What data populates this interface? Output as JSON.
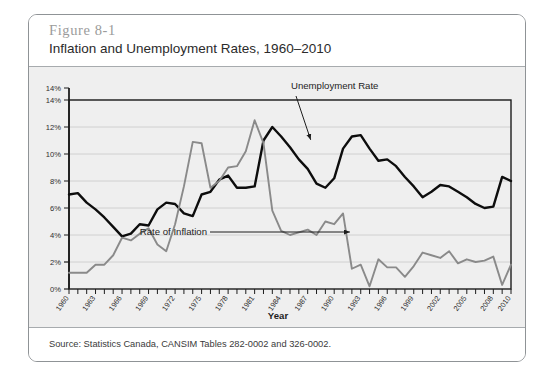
{
  "figure": {
    "number": "Figure 8-1",
    "title": "Inflation and Unemployment Rates, 1960–2010",
    "source": "Source: Statistics Canada, CANSIM Tables 282-0002 and 326-0002."
  },
  "chart_data": {
    "type": "line",
    "title": "Inflation and Unemployment Rates, 1960–2010",
    "xlabel": "Year",
    "ylabel": "",
    "xlim": [
      1960,
      2010
    ],
    "ylim": [
      0,
      14
    ],
    "grid": true,
    "legend_position": "inline-annotations",
    "ytick_labels": [
      "0%",
      "2%",
      "4%",
      "6%",
      "8%",
      "10%",
      "12%",
      "14%"
    ],
    "ytick_values": [
      0,
      2,
      4,
      6,
      8,
      10,
      12,
      14
    ],
    "xtick_labels": [
      "1960",
      "1963",
      "1966",
      "1969",
      "1972",
      "1975",
      "1978",
      "1981",
      "1984",
      "1987",
      "1990",
      "1993",
      "1996",
      "1999",
      "2002",
      "2005",
      "2008",
      "2010"
    ],
    "xtick_values": [
      1960,
      1963,
      1966,
      1969,
      1972,
      1975,
      1978,
      1981,
      1984,
      1987,
      1990,
      1993,
      1996,
      1999,
      2002,
      2005,
      2008,
      2010
    ],
    "x": [
      1960,
      1961,
      1962,
      1963,
      1964,
      1965,
      1966,
      1967,
      1968,
      1969,
      1970,
      1971,
      1972,
      1973,
      1974,
      1975,
      1976,
      1977,
      1978,
      1979,
      1980,
      1981,
      1982,
      1983,
      1984,
      1985,
      1986,
      1987,
      1988,
      1989,
      1990,
      1991,
      1992,
      1993,
      1994,
      1995,
      1996,
      1997,
      1998,
      1999,
      2000,
      2001,
      2002,
      2003,
      2004,
      2005,
      2006,
      2007,
      2008,
      2009,
      2010
    ],
    "series": [
      {
        "name": "Unemployment Rate",
        "color": "#0d0d0d",
        "annotation": "Unemployment Rate",
        "values": [
          7.0,
          7.1,
          6.4,
          5.9,
          5.3,
          4.6,
          3.9,
          4.1,
          4.8,
          4.7,
          5.9,
          6.4,
          6.3,
          5.6,
          5.4,
          7.0,
          7.2,
          8.1,
          8.4,
          7.5,
          7.5,
          7.6,
          11.0,
          12.0,
          11.3,
          10.5,
          9.6,
          8.9,
          7.8,
          7.5,
          8.2,
          10.4,
          11.3,
          11.4,
          10.4,
          9.5,
          9.6,
          9.1,
          8.3,
          7.6,
          6.8,
          7.2,
          7.7,
          7.6,
          7.2,
          6.8,
          6.3,
          6.0,
          6.1,
          8.3,
          8.0
        ]
      },
      {
        "name": "Rate of Inflation",
        "color": "#8a8a8a",
        "annotation": "Rate of Inflation",
        "values": [
          1.2,
          1.2,
          1.2,
          1.8,
          1.8,
          2.5,
          3.8,
          3.6,
          4.1,
          4.5,
          3.3,
          2.8,
          4.8,
          7.6,
          10.9,
          10.8,
          7.5,
          8.0,
          9.0,
          9.1,
          10.2,
          12.5,
          10.8,
          5.8,
          4.3,
          4.0,
          4.2,
          4.4,
          4.0,
          5.0,
          4.8,
          5.6,
          1.5,
          1.8,
          0.2,
          2.2,
          1.6,
          1.6,
          0.9,
          1.7,
          2.7,
          2.5,
          2.3,
          2.8,
          1.9,
          2.2,
          2.0,
          2.1,
          2.4,
          0.3,
          1.8
        ]
      }
    ],
    "annotations": [
      {
        "label": "Unemployment Rate",
        "target_year": 1987,
        "target_value": 10.9
      },
      {
        "label": "Rate of Inflation",
        "target_year": 1992,
        "target_value": 3.1
      }
    ]
  }
}
